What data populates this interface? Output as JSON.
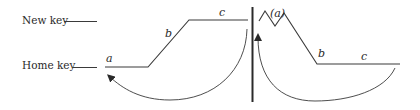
{
  "diagram": {
    "labels": {
      "new_key": "New key",
      "home_key": "Home key"
    },
    "left_figure": {
      "segment_a": "a",
      "segment_b": "b",
      "segment_c": "c"
    },
    "right_figure": {
      "segment_a": "(a)",
      "segment_b": "b",
      "segment_c": "c"
    },
    "colors": {
      "ink": "#3a3a3a",
      "background": "#ffffff"
    }
  }
}
